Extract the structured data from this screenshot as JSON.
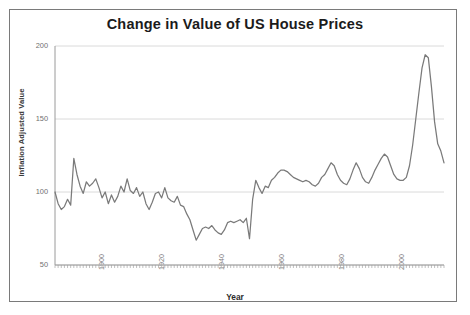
{
  "figure": {
    "title": "Change in Value of US House Prices",
    "border_color": "#7a7a7a",
    "background": "#ffffff"
  },
  "chart_data": {
    "type": "line",
    "title": "Change in Value of US House Prices",
    "xlabel": "Year",
    "ylabel": "Inflation Adjusted Value",
    "xlim": [
      1888,
      2012
    ],
    "ylim": [
      50,
      200
    ],
    "yticks": [
      50,
      100,
      150,
      200
    ],
    "xticks": [
      1900,
      1920,
      1940,
      1960,
      1980,
      2000
    ],
    "grid": "horizontal",
    "legend": "none",
    "line_color": "#7a7a7a",
    "series": [
      {
        "name": "Inflation Adjusted Value",
        "x": [
          1888,
          1889,
          1890,
          1891,
          1892,
          1893,
          1894,
          1895,
          1896,
          1897,
          1898,
          1899,
          1900,
          1901,
          1902,
          1903,
          1904,
          1905,
          1906,
          1907,
          1908,
          1909,
          1910,
          1911,
          1912,
          1913,
          1914,
          1915,
          1916,
          1917,
          1918,
          1919,
          1920,
          1921,
          1922,
          1923,
          1924,
          1925,
          1926,
          1927,
          1928,
          1929,
          1930,
          1931,
          1932,
          1933,
          1934,
          1935,
          1936,
          1937,
          1938,
          1939,
          1940,
          1941,
          1942,
          1943,
          1944,
          1945,
          1946,
          1947,
          1948,
          1949,
          1950,
          1951,
          1952,
          1953,
          1954,
          1955,
          1956,
          1957,
          1958,
          1959,
          1960,
          1961,
          1962,
          1963,
          1964,
          1965,
          1966,
          1967,
          1968,
          1969,
          1970,
          1971,
          1972,
          1973,
          1974,
          1975,
          1976,
          1977,
          1978,
          1979,
          1980,
          1981,
          1982,
          1983,
          1984,
          1985,
          1986,
          1987,
          1988,
          1989,
          1990,
          1991,
          1992,
          1993,
          1994,
          1995,
          1996,
          1997,
          1998,
          1999,
          2000,
          2001,
          2002,
          2003,
          2004,
          2005,
          2006,
          2007,
          2008,
          2009,
          2010,
          2011,
          2012
        ],
        "values": [
          100,
          92,
          88,
          90,
          95,
          91,
          123,
          112,
          104,
          99,
          107,
          104,
          106,
          109,
          103,
          96,
          100,
          92,
          98,
          93,
          97,
          104,
          100,
          109,
          101,
          99,
          103,
          97,
          100,
          92,
          88,
          93,
          99,
          100,
          96,
          103,
          96,
          94,
          93,
          97,
          91,
          90,
          85,
          81,
          74,
          67,
          71,
          75,
          76,
          75,
          77,
          74,
          72,
          71,
          74,
          79,
          80,
          79,
          80,
          81,
          79,
          82,
          68,
          95,
          108,
          103,
          99,
          104,
          103,
          108,
          110,
          113,
          115,
          115,
          114,
          112,
          110,
          109,
          108,
          107,
          108,
          107,
          105,
          104,
          106,
          110,
          112,
          116,
          120,
          118,
          112,
          108,
          106,
          105,
          109,
          115,
          120,
          116,
          110,
          107,
          106,
          110,
          115,
          119,
          123,
          126,
          124,
          118,
          112,
          109,
          108,
          108,
          110,
          118,
          132,
          150,
          168,
          185,
          194,
          192,
          172,
          148,
          133,
          128,
          120
        ]
      }
    ]
  },
  "axes": {
    "y_tick_labels": [
      "200",
      "150",
      "100",
      "50"
    ],
    "x_tick_labels": [
      "1900",
      "1920",
      "1940",
      "1960",
      "1980",
      "2000"
    ],
    "y_axis_title": "Inflation Adjusted Value",
    "x_axis_title": "Year"
  }
}
